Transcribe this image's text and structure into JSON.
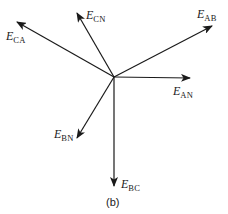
{
  "figure": {
    "caption": "(b)",
    "center": {
      "x": 114,
      "y": 77
    },
    "stroke_color": "#1a1a1a",
    "phasors": [
      {
        "id": "E_CA",
        "main": "E",
        "sub": "CA",
        "tip": {
          "x": 17,
          "y": 22
        },
        "label_pos": {
          "x": 6,
          "y": 30
        }
      },
      {
        "id": "E_CN",
        "main": "E",
        "sub": "CN",
        "tip": {
          "x": 77,
          "y": 13
        },
        "label_pos": {
          "x": 86,
          "y": 9
        }
      },
      {
        "id": "E_AB",
        "main": "E",
        "sub": "AB",
        "tip": {
          "x": 212,
          "y": 26
        },
        "label_pos": {
          "x": 197,
          "y": 8
        }
      },
      {
        "id": "E_AN",
        "main": "E",
        "sub": "AN",
        "tip": {
          "x": 190,
          "y": 78
        },
        "label_pos": {
          "x": 173,
          "y": 85
        }
      },
      {
        "id": "E_BN",
        "main": "E",
        "sub": "BN",
        "tip": {
          "x": 77,
          "y": 138
        },
        "label_pos": {
          "x": 54,
          "y": 128
        }
      },
      {
        "id": "E_BC",
        "main": "E",
        "sub": "BC",
        "tip": {
          "x": 114,
          "y": 186
        },
        "label_pos": {
          "x": 121,
          "y": 178
        }
      }
    ]
  }
}
